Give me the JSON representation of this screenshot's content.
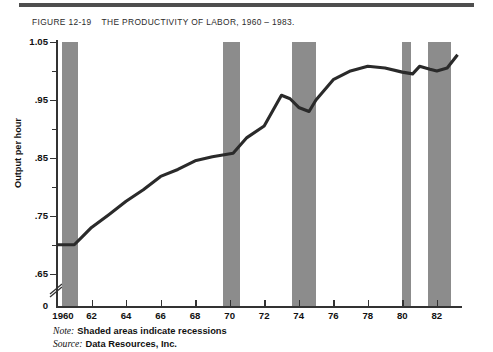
{
  "figure": {
    "number": "FIGURE  12-19",
    "title": "THE PRODUCTIVITY OF LABOR, 1960 – 1983."
  },
  "footnotes": {
    "note_key": "Note:",
    "note_value": "Shaded areas indicate recessions",
    "source_key": "Source:",
    "source_value": "Data Resources, Inc."
  },
  "colors": {
    "recession_band": "#8c8c8c",
    "series_line": "#2a2a2a",
    "axis": "#333333",
    "rule": "#4e4e4e"
  },
  "chart_data": {
    "type": "line",
    "title": "THE PRODUCTIVITY OF LABOR, 1960 – 1983.",
    "xlabel": "",
    "ylabel": "Output per hour",
    "xlim": [
      1960,
      1983.4
    ],
    "ylim": [
      0.6,
      1.05
    ],
    "grid": false,
    "legend": null,
    "y_ticks_major": [
      1.05,
      0.95,
      0.85,
      0.75,
      0.65
    ],
    "y_tick_labels": [
      "1.05",
      ".95",
      ".85",
      ".75",
      ".65",
      "0"
    ],
    "y_ticks_minor": [
      1.0,
      0.9,
      0.8,
      0.7
    ],
    "y_axis_break": true,
    "x_ticks": [
      1960,
      1962,
      1964,
      1966,
      1968,
      1970,
      1972,
      1974,
      1976,
      1978,
      1980,
      1982
    ],
    "x_tick_labels": [
      "1960",
      "62",
      "64",
      "66",
      "68",
      "70",
      "72",
      "74",
      "76",
      "78",
      "80",
      "82"
    ],
    "series": [
      {
        "name": "Output per hour",
        "x": [
          1960.0,
          1960.5,
          1961.0,
          1961.5,
          1962.0,
          1963.0,
          1964.0,
          1965.0,
          1966.0,
          1967.0,
          1968.0,
          1969.0,
          1969.6,
          1970.2,
          1971.0,
          1972.0,
          1973.0,
          1973.5,
          1974.0,
          1974.6,
          1975.0,
          1976.0,
          1977.0,
          1978.0,
          1979.0,
          1980.0,
          1980.6,
          1981.0,
          1981.6,
          1982.0,
          1982.6,
          1983.2
        ],
        "y": [
          0.7,
          0.7,
          0.7,
          0.715,
          0.73,
          0.752,
          0.775,
          0.795,
          0.818,
          0.83,
          0.845,
          0.852,
          0.855,
          0.858,
          0.885,
          0.905,
          0.958,
          0.952,
          0.937,
          0.93,
          0.95,
          0.985,
          1.0,
          1.008,
          1.005,
          0.998,
          0.995,
          1.008,
          1.003,
          1.0,
          1.005,
          1.028
        ]
      }
    ],
    "recessions": [
      {
        "label": "1960-1961",
        "start": 1960.3,
        "end": 1961.2
      },
      {
        "label": "1969-1970",
        "start": 1969.6,
        "end": 1970.6
      },
      {
        "label": "1973-1975",
        "start": 1973.6,
        "end": 1975.0
      },
      {
        "label": "1980",
        "start": 1980.0,
        "end": 1980.5
      },
      {
        "label": "1981-1982",
        "start": 1981.5,
        "end": 1982.8
      }
    ]
  }
}
